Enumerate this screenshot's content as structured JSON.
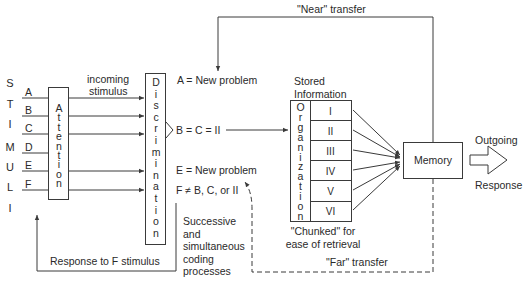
{
  "diagram": {
    "stimuli_label": [
      "S",
      "T",
      "I",
      "M",
      "U",
      "L",
      "I"
    ],
    "inputs": [
      "A",
      "B",
      "C",
      "D",
      "E",
      "F"
    ],
    "attention_label": [
      "A",
      "t",
      "t",
      "e",
      "n",
      "t",
      "i",
      "o",
      "n"
    ],
    "incoming_label": "incoming",
    "stimulus_label": "stimulus",
    "discrimination_label": [
      "D",
      "i",
      "s",
      "c",
      "r",
      "i",
      "m",
      "i",
      "n",
      "a",
      "t",
      "i",
      "o",
      "n"
    ],
    "outcomes": {
      "a": "A = New problem",
      "bc": "B = C = II",
      "e": "E = New problem",
      "f": "F ≠ B, C, or II"
    },
    "coding_note": "Successive\nand\nsimultaneous\ncoding\nprocesses",
    "stored_info_label": "Stored\nInformation",
    "organization_label": [
      "O",
      "r",
      "g",
      "a",
      "n",
      "i",
      "z",
      "a",
      "t",
      "i",
      "o",
      "n"
    ],
    "chunks": [
      "I",
      "II",
      "III",
      "IV",
      "V",
      "VI"
    ],
    "chunked_note": "\"Chunked\" for\nease of retrieval",
    "memory_label": "Memory",
    "outgoing_label": "Outgoing",
    "response_label": "Response",
    "near_transfer_label": "\"Near\" transfer",
    "far_transfer_label": "\"Far\" transfer",
    "response_loop_label": "Response to F stimulus",
    "colors": {
      "line": "#3a3a3a",
      "text": "#2a2a2a",
      "box_fill": "#ffffff"
    }
  }
}
